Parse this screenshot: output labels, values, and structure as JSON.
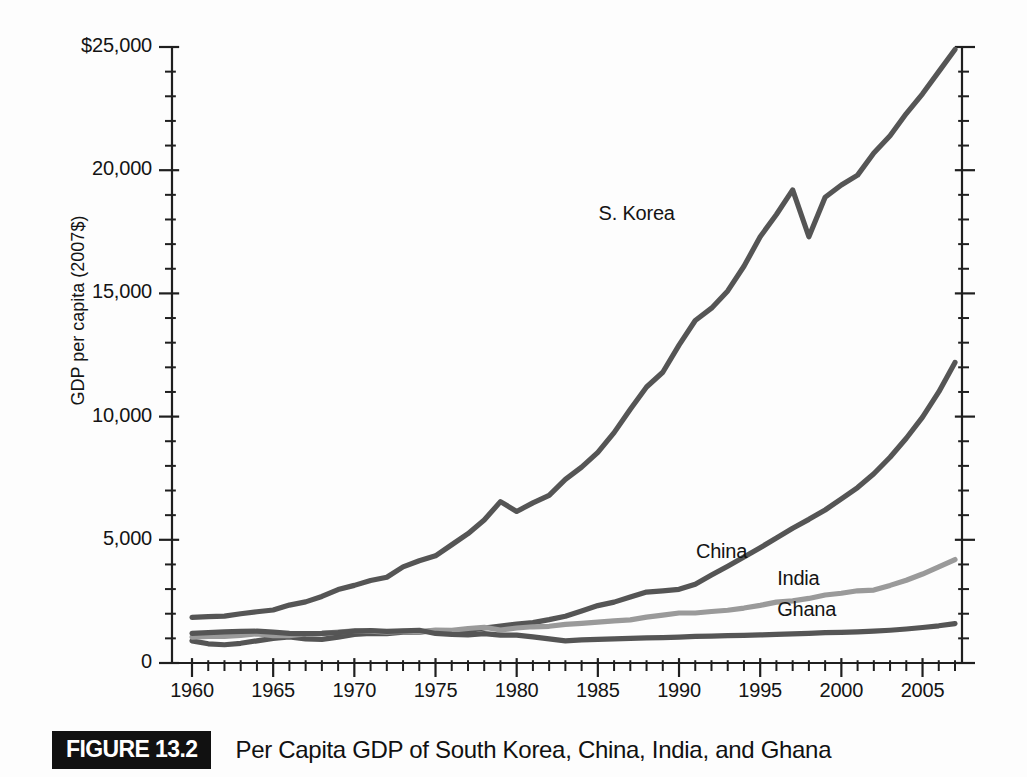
{
  "figure": {
    "badge": "FIGURE 13.2",
    "caption": "Per Capita GDP of South Korea, China, India, and Ghana"
  },
  "chart_data": {
    "type": "line",
    "title": "Per Capita GDP of South Korea, China, India, and Ghana",
    "xlabel": "",
    "ylabel": "GDP per capita (2007$)",
    "xlim": [
      1960,
      2007
    ],
    "ylim": [
      0,
      25000
    ],
    "grid": false,
    "legend_position": "inline-labels",
    "x_major_ticks": [
      1960,
      1965,
      1970,
      1975,
      1980,
      1985,
      1990,
      1995,
      2000,
      2005
    ],
    "x_tick_labels": [
      "1960",
      "1965",
      "1970",
      "1975",
      "1980",
      "1985",
      "1990",
      "1995",
      "2000",
      "2005"
    ],
    "x_minor_tick_step": 1,
    "y_major_ticks": [
      0,
      5000,
      10000,
      15000,
      20000,
      25000
    ],
    "y_tick_labels": [
      "0",
      "5,000",
      "10,000",
      "15,000",
      "20,000",
      "$25,000"
    ],
    "y_minor_tick_step": 1000,
    "x": [
      1960,
      1961,
      1962,
      1963,
      1964,
      1965,
      1966,
      1967,
      1968,
      1969,
      1970,
      1971,
      1972,
      1973,
      1974,
      1975,
      1976,
      1977,
      1978,
      1979,
      1980,
      1981,
      1982,
      1983,
      1984,
      1985,
      1986,
      1987,
      1988,
      1989,
      1990,
      1991,
      1992,
      1993,
      1994,
      1995,
      1996,
      1997,
      1998,
      1999,
      2000,
      2001,
      2002,
      2003,
      2004,
      2005,
      2006,
      2007
    ],
    "series": [
      {
        "name": "S. Korea",
        "color": "#555555",
        "label_x": 1988,
        "label_y": 18200,
        "values": [
          1850,
          1880,
          1900,
          2000,
          2080,
          2150,
          2350,
          2480,
          2700,
          2980,
          3150,
          3350,
          3480,
          3900,
          4150,
          4350,
          4800,
          5250,
          5800,
          6550,
          6150,
          6500,
          6800,
          7450,
          7950,
          8550,
          9350,
          10300,
          11200,
          11800,
          12900,
          13900,
          14400,
          15100,
          16100,
          17300,
          18200,
          19200,
          17300,
          18900,
          19400,
          19800,
          20700,
          21400,
          22300,
          23100,
          24000,
          24900
        ]
      },
      {
        "name": "China",
        "color": "#555555",
        "label_x": 1994,
        "label_y": 4450,
        "values": [
          900,
          780,
          740,
          800,
          900,
          1000,
          1060,
          980,
          960,
          1050,
          1160,
          1200,
          1190,
          1250,
          1250,
          1320,
          1270,
          1310,
          1420,
          1500,
          1580,
          1640,
          1760,
          1900,
          2110,
          2330,
          2470,
          2680,
          2880,
          2930,
          2990,
          3200,
          3570,
          3930,
          4300,
          4680,
          5070,
          5470,
          5830,
          6210,
          6660,
          7120,
          7680,
          8350,
          9120,
          9980,
          11000,
          12200
        ]
      },
      {
        "name": "India",
        "color": "#9a9a9a",
        "label_x": 1999,
        "label_y": 3350,
        "values": [
          1050,
          1080,
          1080,
          1120,
          1180,
          1110,
          1110,
          1180,
          1200,
          1250,
          1310,
          1290,
          1250,
          1280,
          1260,
          1340,
          1330,
          1400,
          1450,
          1340,
          1420,
          1470,
          1490,
          1570,
          1610,
          1660,
          1710,
          1750,
          1860,
          1940,
          2030,
          2030,
          2090,
          2140,
          2230,
          2340,
          2470,
          2520,
          2620,
          2760,
          2830,
          2930,
          2960,
          3150,
          3360,
          3610,
          3900,
          4200
        ]
      },
      {
        "name": "Ghana",
        "color": "#555555",
        "label_x": 1999,
        "label_y": 2100,
        "values": [
          1200,
          1230,
          1260,
          1280,
          1290,
          1250,
          1200,
          1190,
          1200,
          1230,
          1290,
          1320,
          1280,
          1300,
          1330,
          1200,
          1160,
          1140,
          1190,
          1130,
          1130,
          1060,
          980,
          900,
          940,
          960,
          980,
          1000,
          1020,
          1030,
          1050,
          1080,
          1090,
          1110,
          1120,
          1140,
          1160,
          1180,
          1200,
          1230,
          1240,
          1260,
          1290,
          1330,
          1380,
          1440,
          1510,
          1600
        ]
      }
    ]
  },
  "axes": {
    "y_label": "GDP per capita (2007$)"
  }
}
